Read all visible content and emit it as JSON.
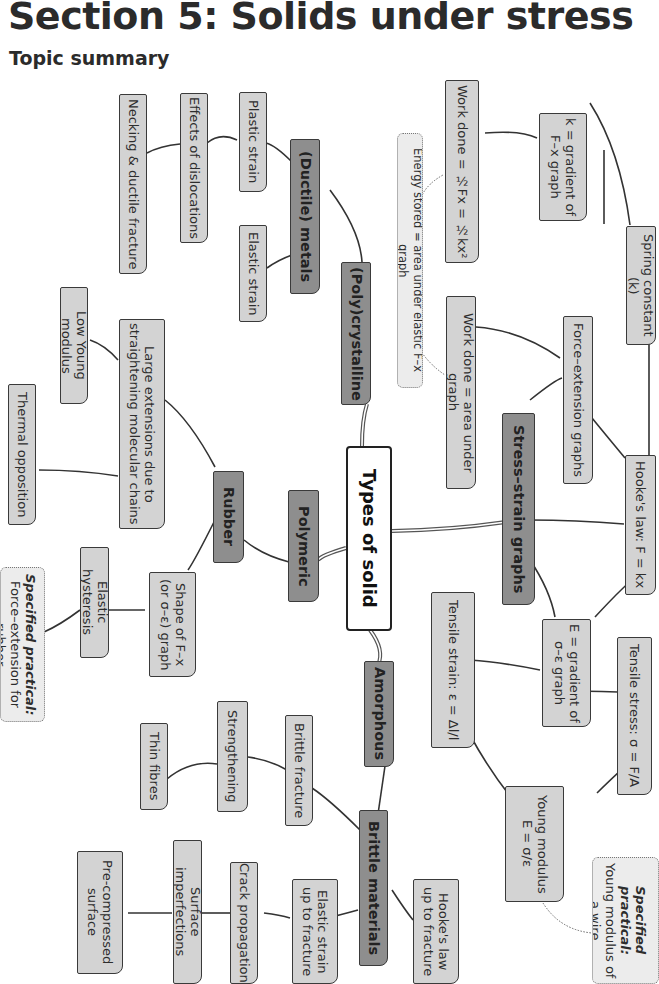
{
  "header": {
    "title": "Section 5: Solids under stress",
    "subtitle": "Topic summary"
  },
  "diagram": {
    "orientation": "rotated 90° clockwise",
    "colors": {
      "root_fill": "#ffffff",
      "main_fill": "#8e8e8e",
      "category_fill": "#a3a3a3",
      "leaf_fill": "#d3d3d3",
      "note_fill": "#ececec",
      "line": "#333333"
    },
    "root": {
      "label": "Types of solid"
    },
    "nodes": {
      "polycrystalline": "(Poly)crystalline",
      "ductile_metals": "(Ductile) metals",
      "plastic_strain": "Plastic strain",
      "elastic_strain": "Elastic strain",
      "effects_of_dislocations": "Effects of dislocations",
      "necking": "Necking & ductile fracture",
      "polymeric": "Polymeric",
      "rubber": "Rubber",
      "large_extensions": "Large extensions due to\nstraightening molecular chains",
      "low_young_modulus": "Low Young modulus",
      "thermal_opposition": "Thermal opposition",
      "shape_of_fx": "Shape of F–x\n(or σ–ε) graph",
      "elastic_hysteresis": "Elastic hysteresis",
      "practical_rubber_title": "Specified practical:",
      "practical_rubber_text": "Force–extension for rubber",
      "amorphous": "Amorphous",
      "brittle_materials": "Brittle materials",
      "brittle_fracture": "Brittle fracture",
      "strengthening": "Strengthening",
      "thin_fibres": "Thin fibres",
      "hookes_law_fracture": "Hooke's law\nup to fracture",
      "elastic_strain_fracture": "Elastic strain\nup to fracture",
      "crack_propagation": "Crack propagation",
      "surface_imperfections": "Surface imperfections",
      "pre_compressed": "Pre-compressed\nsurface",
      "stress_strain_graphs": "Stress–strain graphs",
      "force_extension_graphs": "Force–extension graphs",
      "hookes_law": "Hooke's law:  F = kx",
      "spring_constant": "Spring constant (k)",
      "k_gradient": "k = gradient of\nF–x graph",
      "work_done_formula": "Work done = ½Fx = ½kx²",
      "energy_stored": "Energy stored = area under elastic F–x graph",
      "work_done_area": "Work done = area under graph",
      "e_gradient": "E = gradient of\nσ–ε graph",
      "tensile_stress": "Tensile stress: σ = F/A",
      "tensile_strain": "Tensile strain: ε = Δl/l",
      "young_modulus": "Young modulus\nE = σ/ε",
      "practical_wire_title": "Specified practical:",
      "practical_wire_text": "Young modulus of\na wire"
    }
  }
}
